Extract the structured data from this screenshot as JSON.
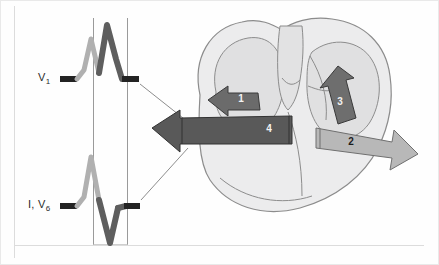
{
  "figure": {
    "background_color": "#fefefe",
    "border_color": "#e9e9e9"
  },
  "ecg_panel": {
    "traces": [
      {
        "id": "trace-v1",
        "label": "V",
        "label_sub": "1",
        "label_full": "V1",
        "description": "rSR' pattern: small light-gray initial r wave followed by tall dark R' wave",
        "baseline_color": "#232323",
        "initial_deflection_color": "#b0b0b0",
        "terminal_deflection_color": "#5e5e5e"
      },
      {
        "id": "trace-i-v6",
        "label": "I, V",
        "label_sub": "6",
        "label_full": "I, V6",
        "description": "Tall light-gray R wave followed by wide deep dark S wave",
        "baseline_color": "#232323",
        "initial_deflection_color": "#b0b0b0",
        "terminal_deflection_color": "#5e5e5e"
      }
    ],
    "qrs_box": {
      "name": "qrs-duration-box",
      "description": "Vertical lines marking QRS onset and offset across both leads",
      "line_color": "#9a9a9a"
    },
    "leader_lines": {
      "name": "leader-lines",
      "count": 2,
      "color": "#8d8d8d",
      "description": "Thin diagonal lines linking QRS offset of each lead to the main vector arrow"
    }
  },
  "heart_panel": {
    "description": "Coronal cross-section of the heart showing four sequential depolarization vectors",
    "outline_color": "#8c8c8c",
    "myocardium_fill": "#ececed",
    "chamber_fill": "#e0e0e1",
    "vectors": [
      {
        "number": "1",
        "name": "vector-1-septal",
        "direction": "left",
        "color": "#6b6b6b",
        "label_on_dark": true
      },
      {
        "number": "2",
        "name": "vector-2-left-free-wall",
        "direction": "right-down",
        "color": "#b8b8b8",
        "label_on_dark": false
      },
      {
        "number": "3",
        "name": "vector-3-right-ventricle",
        "direction": "up-right",
        "color": "#6e6e6e",
        "label_on_dark": true
      },
      {
        "number": "4",
        "name": "vector-4-main-qrs",
        "direction": "left",
        "color": "#595959",
        "label_on_dark": true
      }
    ]
  }
}
